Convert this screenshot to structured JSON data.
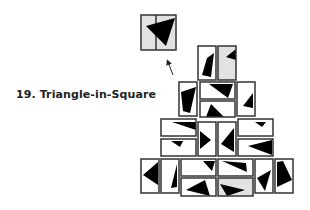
{
  "title": "19. Triangle-in-Square",
  "colors": {
    "stroke": "#333333",
    "fill_white": "#ffffff",
    "fill_gray": "#e2e2e2",
    "triangle": "#000000",
    "arrow": "#222222"
  },
  "target": {
    "x": 141,
    "y": 15,
    "w": 35,
    "h": 35,
    "split_x": 156,
    "triangle": "146,26 175,18 166,46"
  },
  "arrow": {
    "x1": 173,
    "y1": 75,
    "x2": 168,
    "y2": 62
  },
  "tiles": [
    {
      "x": 198,
      "y": 46,
      "w": 18,
      "h": 34,
      "fill": "white",
      "tri": "207,58 214,53 211,77 202,75"
    },
    {
      "x": 218,
      "y": 46,
      "w": 18,
      "h": 34,
      "fill": "gray",
      "tri": "226,57 236,49 236,60"
    },
    {
      "x": 179,
      "y": 82,
      "w": 18,
      "h": 34,
      "fill": "white",
      "tri": "181,92 196,87 190,113 183,111"
    },
    {
      "x": 200,
      "y": 82,
      "w": 35,
      "h": 17,
      "fill": "white",
      "tri": "209,84 233,84 228,98"
    },
    {
      "x": 200,
      "y": 101,
      "w": 35,
      "h": 16,
      "fill": "white",
      "tri": "206,117 211,104 224,117"
    },
    {
      "x": 237,
      "y": 82,
      "w": 18,
      "h": 34,
      "fill": "white",
      "tri": "243,106 253,93 253,108"
    },
    {
      "x": 161,
      "y": 119,
      "w": 35,
      "h": 17,
      "fill": "white",
      "tri": "172,122 196,122 196,130"
    },
    {
      "x": 161,
      "y": 139,
      "w": 35,
      "h": 17,
      "fill": "white",
      "tri": "171,141 183,141 180,147"
    },
    {
      "x": 198,
      "y": 122,
      "w": 18,
      "h": 34,
      "fill": "white",
      "tri": "200,131 211,140 200,149"
    },
    {
      "x": 218,
      "y": 122,
      "w": 18,
      "h": 34,
      "fill": "white",
      "tri": "221,144 234,128 234,152"
    },
    {
      "x": 238,
      "y": 119,
      "w": 35,
      "h": 17,
      "fill": "white",
      "tri": "255,122 266,122 262,127"
    },
    {
      "x": 238,
      "y": 139,
      "w": 35,
      "h": 17,
      "fill": "white",
      "tri": "248,146 272,140 272,155"
    },
    {
      "x": 141,
      "y": 159,
      "w": 18,
      "h": 34,
      "fill": "white",
      "tri": "143,175 158,162 158,185"
    },
    {
      "x": 161,
      "y": 159,
      "w": 18,
      "h": 34,
      "fill": "white",
      "tri": "171,188 177,164 177,187"
    },
    {
      "x": 181,
      "y": 159,
      "w": 35,
      "h": 17,
      "fill": "white",
      "tri": "203,161 215,161 212,171"
    },
    {
      "x": 181,
      "y": 178,
      "w": 35,
      "h": 18,
      "fill": "white",
      "tri": "186,190 205,180 210,196"
    },
    {
      "x": 218,
      "y": 159,
      "w": 35,
      "h": 17,
      "fill": "white",
      "tri": "222,161 246,163 247,172"
    },
    {
      "x": 218,
      "y": 178,
      "w": 35,
      "h": 18,
      "fill": "gray",
      "tri": "220,184 227,196 245,190"
    },
    {
      "x": 255,
      "y": 159,
      "w": 18,
      "h": 34,
      "fill": "white",
      "tri": "257,178 271,170 265,191"
    },
    {
      "x": 275,
      "y": 159,
      "w": 18,
      "h": 34,
      "fill": "white",
      "tri": "277,162 283,161 292,180 277,187"
    }
  ]
}
